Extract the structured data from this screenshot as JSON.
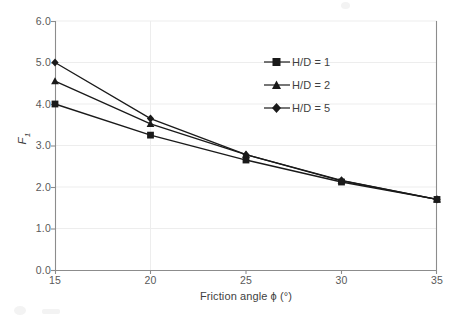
{
  "chart_data": {
    "type": "line",
    "title": "",
    "xlabel": "Friction angle ϕ (°)",
    "ylabel": "F₁",
    "ylabel_base": "F",
    "ylabel_sub": "1",
    "x": [
      15,
      20,
      25,
      30,
      35
    ],
    "xlim": [
      15,
      35
    ],
    "ylim": [
      0.0,
      6.0
    ],
    "xticks": [
      "15",
      "20",
      "25",
      "30",
      "35"
    ],
    "yticks": [
      "0.0",
      "1.0",
      "2.0",
      "3.0",
      "4.0",
      "5.0",
      "6.0"
    ],
    "grid": "horizontal-major-faint",
    "legend_position": "upper-right-inside",
    "series": [
      {
        "name": "H/D = 1",
        "marker": "square",
        "color": "#1a1a1a",
        "values": [
          4.0,
          3.25,
          2.65,
          2.12,
          1.7
        ]
      },
      {
        "name": "H/D = 2",
        "marker": "triangle",
        "color": "#1a1a1a",
        "values": [
          4.55,
          3.52,
          2.78,
          2.15,
          1.7
        ]
      },
      {
        "name": "H/D = 5",
        "marker": "diamond",
        "color": "#1a1a1a",
        "values": [
          5.0,
          3.65,
          2.78,
          2.16,
          1.7
        ]
      }
    ]
  },
  "axes": {
    "y_tick_labels": [
      "6.0",
      "5.0",
      "4.0",
      "3.0",
      "2.0",
      "1.0",
      "0.0"
    ],
    "x_tick_labels": [
      "15",
      "20",
      "25",
      "30",
      "35"
    ]
  },
  "legend": {
    "items": [
      {
        "label": "H/D = 1",
        "marker": "square"
      },
      {
        "label": "H/D = 2",
        "marker": "triangle"
      },
      {
        "label": "H/D = 5",
        "marker": "diamond"
      }
    ]
  }
}
